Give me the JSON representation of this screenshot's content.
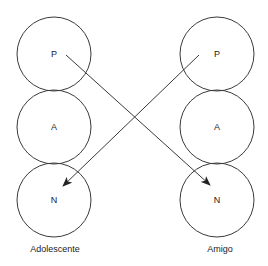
{
  "diagram": {
    "type": "transactional-analysis",
    "columns": [
      {
        "label": "Adolescente",
        "states": [
          {
            "letter": "P"
          },
          {
            "letter": "A"
          },
          {
            "letter": "N"
          }
        ]
      },
      {
        "label": "Amigo",
        "states": [
          {
            "letter": "P"
          },
          {
            "letter": "A"
          },
          {
            "letter": "N"
          }
        ]
      }
    ],
    "arrows": [
      {
        "from": "Adolescente.P",
        "to": "Amigo.N"
      },
      {
        "from": "Amigo.P",
        "to": "Adolescente.N"
      }
    ],
    "colors": {
      "stroke": "#3a3a3a",
      "text": "#222222",
      "background": "#ffffff"
    }
  }
}
